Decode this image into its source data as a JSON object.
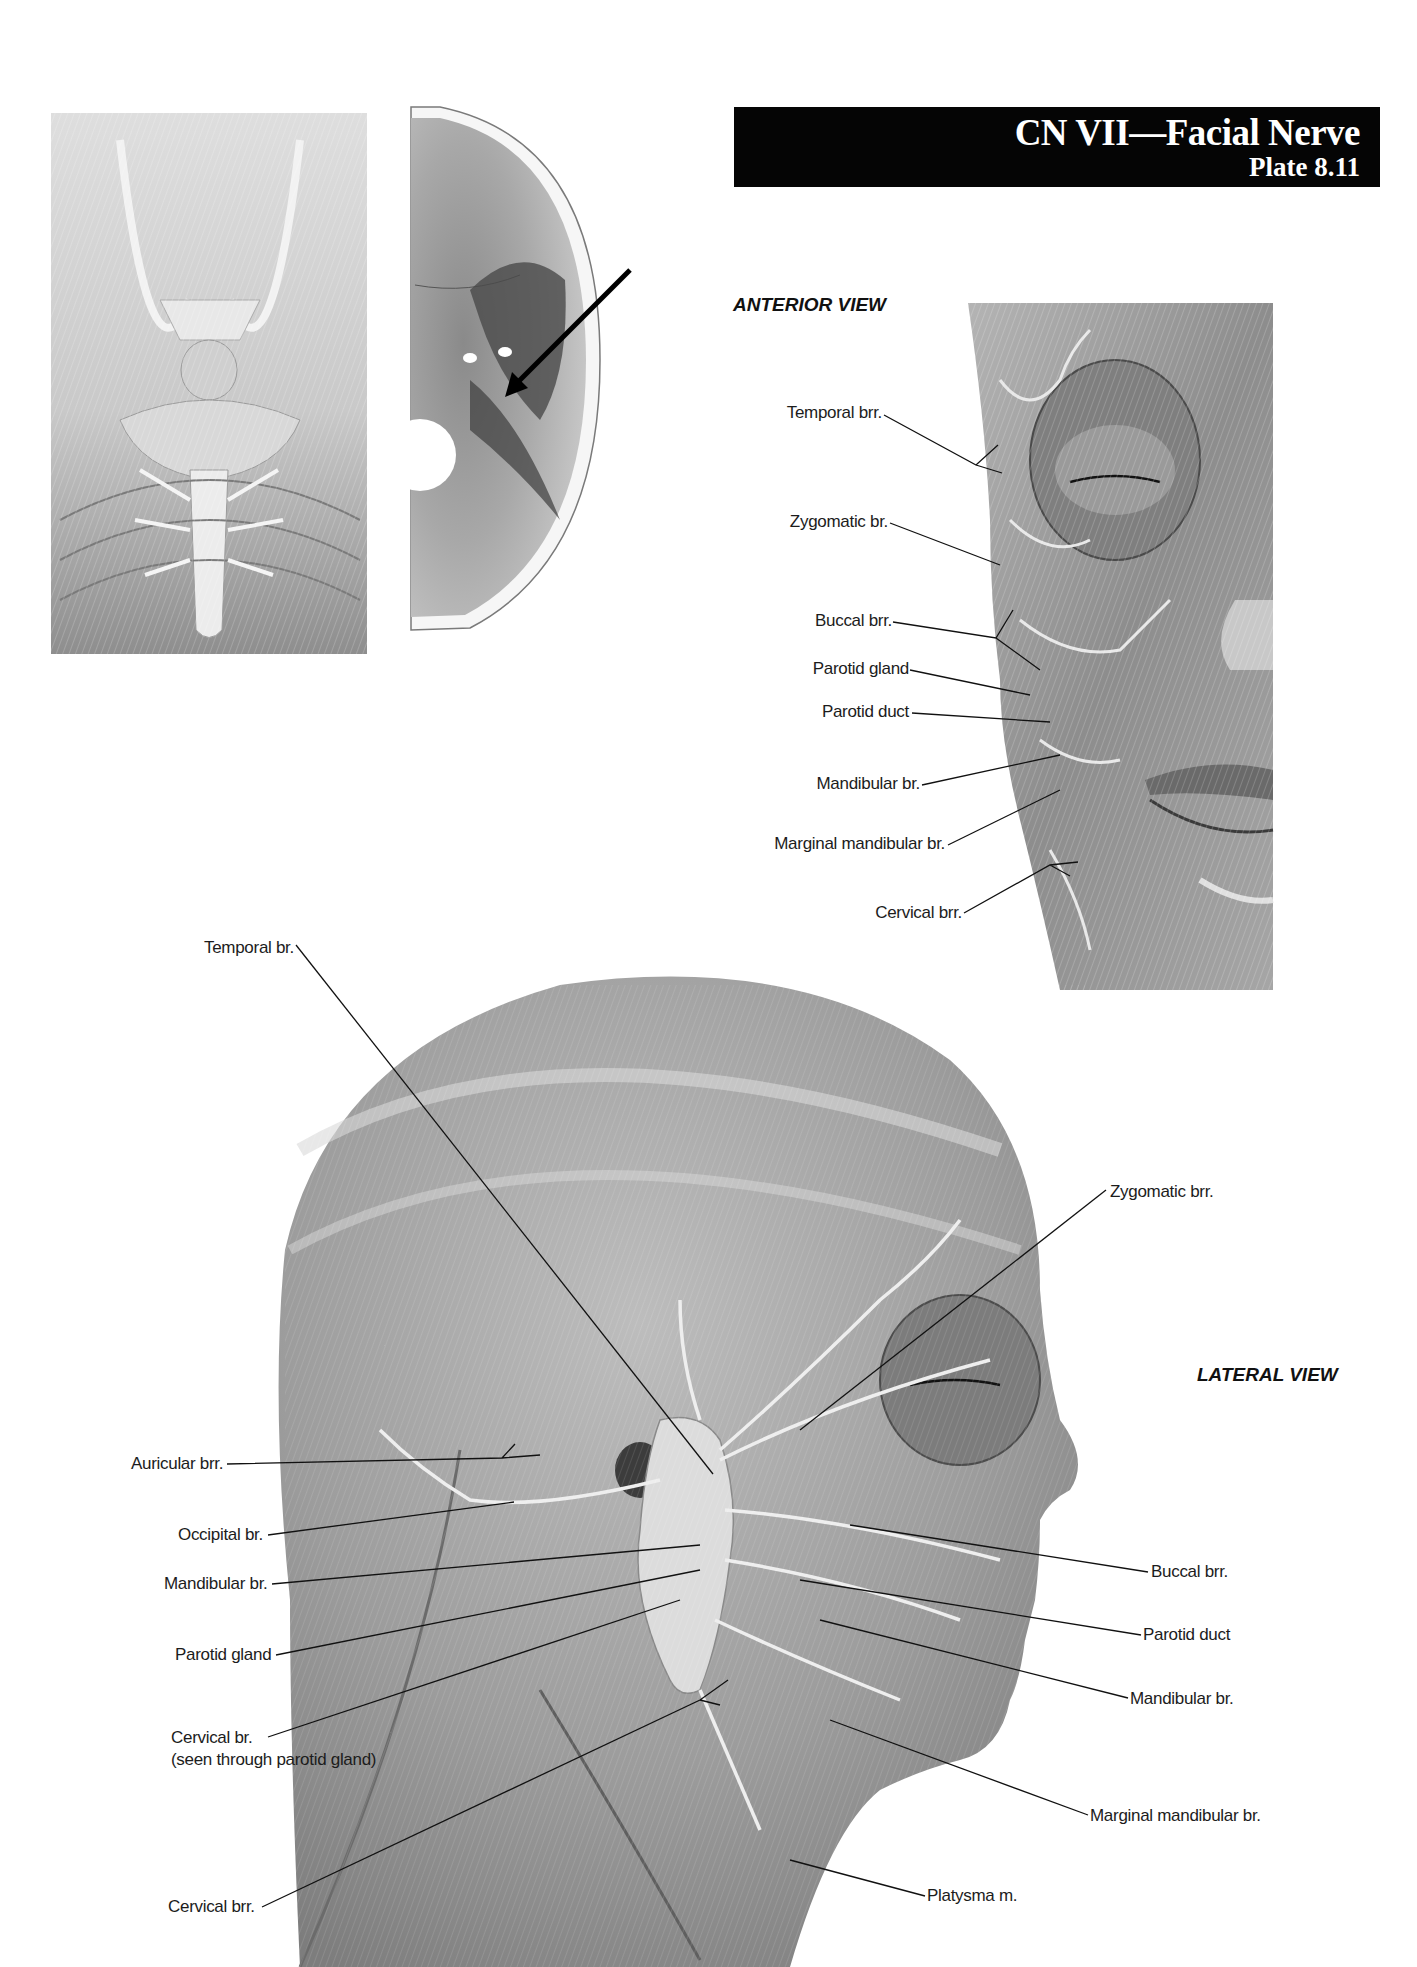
{
  "header": {
    "title": "CN VII—Facial Nerve",
    "plate": "Plate 8.11"
  },
  "panels": {
    "brain_base": {
      "description": "Inferior view of brain and brainstem"
    },
    "cranial_base": {
      "description": "Internal cranial base with arrow indicating internal acoustic meatus"
    }
  },
  "anterior_view": {
    "title": "ANTERIOR VIEW",
    "labels": [
      {
        "text": "Temporal brr."
      },
      {
        "text": "Zygomatic br."
      },
      {
        "text": "Buccal brr."
      },
      {
        "text": "Parotid gland"
      },
      {
        "text": "Parotid duct"
      },
      {
        "text": "Mandibular br."
      },
      {
        "text": "Marginal mandibular br."
      },
      {
        "text": "Cervical brr."
      }
    ]
  },
  "lateral_view": {
    "title": "LATERAL VIEW",
    "labels_left": [
      {
        "text": "Temporal br."
      },
      {
        "text": "Auricular brr."
      },
      {
        "text": "Occipital br."
      },
      {
        "text": "Mandibular br."
      },
      {
        "text": "Parotid gland"
      },
      {
        "text": "Cervical br.",
        "subtext": "(seen through parotid gland)"
      },
      {
        "text": "Cervical brr."
      }
    ],
    "labels_right": [
      {
        "text": "Zygomatic brr."
      },
      {
        "text": "Buccal brr."
      },
      {
        "text": "Parotid duct"
      },
      {
        "text": "Mandibular br."
      },
      {
        "text": "Marginal mandibular br."
      },
      {
        "text": "Platysma m."
      }
    ]
  },
  "colors": {
    "title_bar": "#050505",
    "title_text": "#ffffff",
    "label_text": "#1c1c1c",
    "illustration_gray": "#9a9a9a"
  }
}
